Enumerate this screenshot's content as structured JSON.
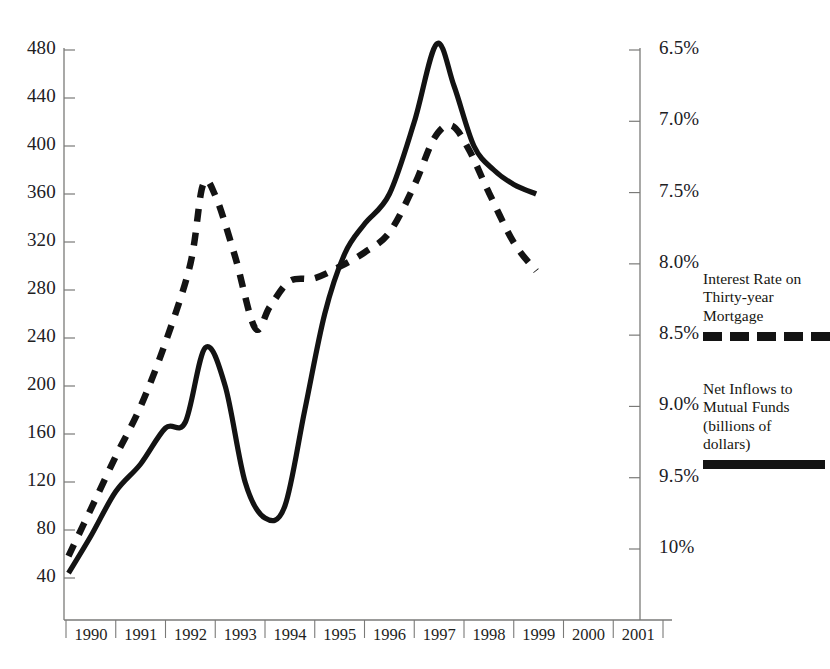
{
  "chart_data": {
    "type": "line",
    "title": "",
    "xlabel": "",
    "grid": false,
    "legend_position": "right",
    "x_ticks": [
      "1990",
      "1991",
      "1992",
      "1993",
      "1994",
      "1995",
      "1996",
      "1997",
      "1998",
      "1999",
      "2000",
      "2001"
    ],
    "axes": {
      "left": {
        "label": "Net Inflows to Mutual Funds (billions of dollars)",
        "ticks": [
          "40",
          "80",
          "120",
          "160",
          "200",
          "240",
          "280",
          "320",
          "360",
          "400",
          "440",
          "480"
        ],
        "min": 40,
        "max": 480,
        "step": 40,
        "inverted": false
      },
      "right": {
        "label": "Interest Rate on Thirty-year Mortgage",
        "ticks": [
          "6.5%",
          "7.0%",
          "7.5%",
          "8.0%",
          "8.5%",
          "9.0%",
          "9.5%",
          "10%"
        ],
        "min": 6.5,
        "max": 10.0,
        "step": 0.5,
        "inverted": true
      }
    },
    "series": [
      {
        "name": "Interest Rate on Thirty-year Mortgage",
        "axis": "right",
        "style": "dashed",
        "color": "#131313",
        "x": [
          1990.05,
          1990.5,
          1991.0,
          1991.5,
          1992.0,
          1992.5,
          1992.75,
          1993.0,
          1993.4,
          1993.8,
          1994.1,
          1994.5,
          1995.0,
          1995.5,
          1996.0,
          1996.5,
          1997.0,
          1997.4,
          1997.75,
          1998.1,
          1998.5,
          1999.0,
          1999.45
        ],
        "values": [
          10.05,
          9.72,
          9.35,
          9.0,
          8.55,
          8.0,
          7.45,
          7.52,
          7.95,
          8.45,
          8.3,
          8.12,
          8.1,
          8.02,
          7.92,
          7.78,
          7.45,
          7.12,
          7.03,
          7.2,
          7.5,
          7.85,
          8.05
        ]
      },
      {
        "name": "Net Inflows to Mutual Funds (billions of dollars)",
        "axis": "left",
        "style": "solid",
        "color": "#131313",
        "x": [
          1990.05,
          1990.5,
          1991.0,
          1991.5,
          1992.0,
          1992.4,
          1992.8,
          1993.2,
          1993.6,
          1994.0,
          1994.4,
          1994.8,
          1995.2,
          1995.6,
          1996.0,
          1996.5,
          1997.0,
          1997.45,
          1997.8,
          1998.2,
          1998.6,
          1999.0,
          1999.45
        ],
        "values": [
          44,
          75,
          112,
          135,
          165,
          170,
          232,
          200,
          120,
          90,
          100,
          180,
          260,
          310,
          335,
          360,
          420,
          485,
          450,
          400,
          380,
          368,
          360
        ]
      }
    ]
  },
  "legend": {
    "items": [
      {
        "id": "interest-rate",
        "text": "Interest Rate on\nThirty-year\nMortgage",
        "style": "dashed"
      },
      {
        "id": "net-inflows",
        "text": "Net Inflows to\nMutual Funds\n(billions of\ndollars)",
        "style": "solid"
      }
    ]
  },
  "colors": {
    "line": "#131313",
    "axis": "#7a7a78",
    "text": "#1a1a1a"
  }
}
